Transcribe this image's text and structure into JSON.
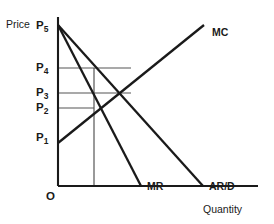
{
  "figure": {
    "type": "economics-diagram",
    "width": 274,
    "height": 224,
    "background_color": "#ffffff",
    "line_color": "#1a1a1a",
    "thin_line_color": "#555555"
  },
  "axes": {
    "y_title": "Price",
    "x_title": "Quantity",
    "origin_label": "O",
    "origin_px": {
      "x": 58,
      "y": 186
    },
    "y_axis_top_px": 17,
    "x_axis_right_px": 258
  },
  "price_levels": [
    {
      "id": "P5",
      "base": "P",
      "sub": "5",
      "label_x": 36,
      "label_y": 20,
      "y_px": 25,
      "guide_to_x": 58
    },
    {
      "id": "P4",
      "base": "P",
      "sub": "4",
      "label_x": 36,
      "label_y": 62,
      "y_px": 68,
      "guide_to_x": 131
    },
    {
      "id": "P3",
      "base": "P",
      "sub": "3",
      "label_x": 36,
      "label_y": 87,
      "y_px": 93,
      "guide_to_x": 131
    },
    {
      "id": "P2",
      "base": "P",
      "sub": "2",
      "label_x": 36,
      "label_y": 102,
      "y_px": 108,
      "guide_to_x": 94
    },
    {
      "id": "P1",
      "base": "P",
      "sub": "1",
      "label_x": 36,
      "label_y": 132,
      "y_px": 138,
      "guide_to_x": 58
    }
  ],
  "quantity_guide": {
    "name": "output-guide-line",
    "x_px": 94,
    "y_top_px": 68,
    "y_bottom_px": 186
  },
  "curves": [
    {
      "id": "MC",
      "label": "MC",
      "label_x": 212,
      "label_y": 27,
      "from": {
        "x": 58,
        "y": 143
      },
      "to": {
        "x": 204,
        "y": 25
      },
      "stroke_width": 2.3
    },
    {
      "id": "AR/D",
      "label": "AR/D",
      "label_x": 209,
      "label_y": 181,
      "from": {
        "x": 58,
        "y": 25
      },
      "to": {
        "x": 203,
        "y": 186
      },
      "stroke_width": 2.3
    },
    {
      "id": "MR",
      "label": "MR",
      "label_x": 147,
      "label_y": 181,
      "from": {
        "x": 58,
        "y": 25
      },
      "to": {
        "x": 141,
        "y": 186
      },
      "stroke_width": 2.3
    }
  ],
  "chart_data": {
    "type": "line",
    "title": "",
    "xlabel": "Quantity",
    "ylabel": "Price",
    "grid": false,
    "legend": "inline-curve-labels",
    "x_tick_labels": [],
    "y_tick_labels": [
      "P1",
      "P2",
      "P3",
      "P4",
      "P5"
    ],
    "series": [
      {
        "name": "MC",
        "type": "line",
        "points": [
          [
            0,
            1.0
          ],
          [
            6.1,
            6.8
          ]
        ],
        "note": "upward sloping marginal cost"
      },
      {
        "name": "AR/D",
        "type": "line",
        "points": [
          [
            0,
            6.8
          ],
          [
            6.05,
            0
          ]
        ],
        "note": "downward sloping average revenue / demand"
      },
      {
        "name": "MR",
        "type": "line",
        "points": [
          [
            0,
            6.8
          ],
          [
            3.45,
            0
          ]
        ],
        "note": "marginal revenue, twice the slope of AR/D"
      }
    ],
    "annotations": [
      {
        "text": "P5",
        "note": "vertical intercept of AR/D and MR"
      },
      {
        "text": "P4",
        "note": "price on AR/D at the profit maximising output"
      },
      {
        "text": "P3",
        "note": "price where MC crosses AR/D"
      },
      {
        "text": "P2",
        "note": "MC = MR equilibrium level"
      },
      {
        "text": "P1",
        "note": "vertical intercept of MC"
      },
      {
        "text": "O",
        "note": "origin"
      }
    ]
  }
}
